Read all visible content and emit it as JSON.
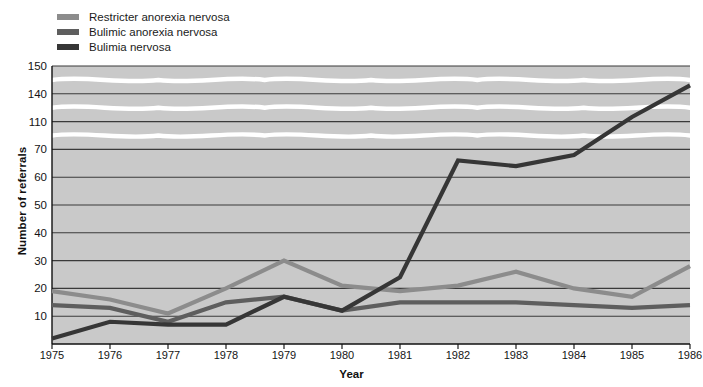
{
  "chart_data": {
    "type": "line",
    "title": "",
    "xlabel": "Year",
    "ylabel": "Number of referrals",
    "x": [
      1975,
      1976,
      1977,
      1978,
      1979,
      1980,
      1981,
      1982,
      1983,
      1984,
      1985,
      1986
    ],
    "x_tick_labels": [
      "1975",
      "1976",
      "1977",
      "1978",
      "1979",
      "1980",
      "1981",
      "1982",
      "1983",
      "1984",
      "1985",
      "1986"
    ],
    "y_tick_labels": [
      "10",
      "20",
      "30",
      "40",
      "50",
      "60",
      "70",
      "110",
      "140",
      "150"
    ],
    "y_tick_values": [
      10,
      20,
      30,
      40,
      50,
      60,
      70,
      110,
      140,
      150
    ],
    "y_axis_broken": true,
    "y_axis_breaks": [
      [
        70,
        110
      ],
      [
        110,
        140
      ],
      [
        140,
        150
      ]
    ],
    "ylim": [
      0,
      150
    ],
    "grid": true,
    "legend_position": "top-left",
    "plot_background": "#c9c9c9",
    "grid_color": "#3a3a3a",
    "break_marker_color": "#ffffff",
    "series": [
      {
        "name": "Restricter anorexia nervosa",
        "color": "#8c8c8c",
        "values": [
          19,
          16,
          11,
          20,
          30,
          21,
          19,
          21,
          26,
          20,
          17,
          28
        ]
      },
      {
        "name": "Bulimic anorexia nervosa",
        "color": "#5e5e5e",
        "values": [
          14,
          13,
          8,
          15,
          17,
          12,
          15,
          15,
          15,
          14,
          13,
          14
        ]
      },
      {
        "name": "Bulimia nervosa",
        "color": "#363636",
        "values": [
          2,
          8,
          7,
          7,
          17,
          12,
          24,
          66,
          64,
          68,
          115,
          143
        ]
      }
    ]
  },
  "legend": {
    "items": [
      {
        "label": "Restricter anorexia nervosa",
        "color": "#8c8c8c"
      },
      {
        "label": "Bulimic anorexia nervosa",
        "color": "#5e5e5e"
      },
      {
        "label": "Bulimia nervosa",
        "color": "#363636"
      }
    ]
  },
  "axes": {
    "y_title": "Number of referrals",
    "x_title": "Year"
  }
}
